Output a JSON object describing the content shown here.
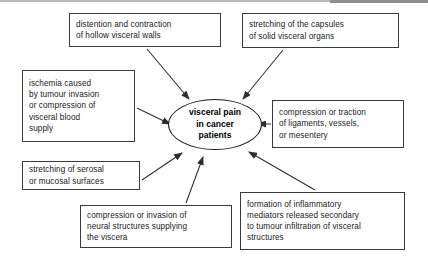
{
  "diagram": {
    "type": "hub-and-spoke concept map",
    "center": {
      "id": "visceral-pain-center",
      "shape": "ellipse",
      "lines": [
        "visceral pain",
        "in cancer",
        "patients"
      ]
    },
    "nodes": [
      {
        "id": "distention-contraction",
        "lines": [
          "distention and contraction",
          "of hollow visceral walls"
        ],
        "position": "top-left"
      },
      {
        "id": "stretching-capsules",
        "lines": [
          "stretching of the capsules",
          "of solid visceral organs"
        ],
        "position": "top-right"
      },
      {
        "id": "ischemia",
        "lines": [
          "ischemia caused",
          "by tumour invasion",
          "or compression of",
          "visceral blood",
          "supply"
        ],
        "position": "left-upper"
      },
      {
        "id": "compression-traction-ligaments",
        "lines": [
          "compression or traction",
          "of ligaments, vessels,",
          "or mesentery"
        ],
        "position": "right-middle"
      },
      {
        "id": "stretching-serosal",
        "lines": [
          "stretching of serosal",
          "or mucosal surfaces"
        ],
        "position": "left-lower"
      },
      {
        "id": "compression-invasion-neural",
        "lines": [
          "compression or invasion of",
          "neural structures supplying",
          "the viscera"
        ],
        "position": "bottom-left"
      },
      {
        "id": "inflammatory-mediators",
        "lines": [
          "formation of inflammatory",
          "mediators released secondary",
          "to tumour infiltration of visceral",
          "structures"
        ],
        "position": "bottom-right"
      }
    ],
    "arrow_count": 7,
    "colors": {
      "line": "#3a3a3a",
      "center_border": "#1c1c1c",
      "text": "#1a1a1a",
      "background": "#ffffff"
    }
  }
}
